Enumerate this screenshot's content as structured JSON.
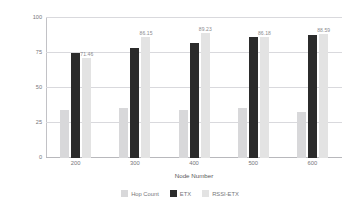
{
  "chart_data": {
    "type": "bar",
    "title": "",
    "xlabel": "Node Number",
    "ylabel": "Nodes with parent change(%)",
    "categories": [
      "200",
      "300",
      "400",
      "500",
      "600"
    ],
    "ylim": [
      0,
      100
    ],
    "yticks": [
      "0",
      "25",
      "50",
      "75",
      "100"
    ],
    "grid": true,
    "legend_position": "bottom",
    "series": [
      {
        "name": "Hop Count",
        "color": "#d8d8da",
        "values": [
          34.5,
          36.0,
          34.5,
          35.5,
          33.0
        ],
        "labels": [
          "",
          "",
          "",
          "",
          ""
        ]
      },
      {
        "name": "ETX",
        "color": "#2b2b2b",
        "values": [
          75.0,
          78.5,
          82.5,
          86.5,
          88.0
        ],
        "labels": [
          "",
          "",
          "",
          "",
          ""
        ]
      },
      {
        "name": "RSSI-ETX",
        "color": "#e3e3e3",
        "values": [
          71.46,
          86.15,
          89.23,
          86.18,
          88.59
        ],
        "labels": [
          "71.46",
          "86.15",
          "89.23",
          "86.18",
          "88.59"
        ]
      }
    ]
  }
}
